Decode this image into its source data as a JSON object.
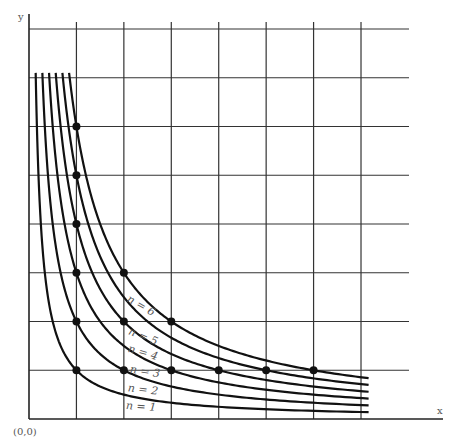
{
  "chart_data": {
    "type": "line",
    "title": "",
    "xlabel": "x",
    "ylabel": "y",
    "origin_label": "(0,0)",
    "xlim": [
      0,
      8.6
    ],
    "ylim": [
      0,
      8.2
    ],
    "grid": true,
    "grid_x_ticks": [
      1,
      2,
      3,
      4,
      5,
      6,
      7
    ],
    "grid_y_ticks": [
      1,
      2,
      3,
      4,
      5,
      6,
      7,
      8
    ],
    "curve_x_range_end": 7.16,
    "curve_y_top": 7.1,
    "series": [
      {
        "name": "n = 1",
        "n": 1,
        "points": [
          [
            1,
            1
          ]
        ]
      },
      {
        "name": "n = 2",
        "n": 2,
        "points": [
          [
            1,
            2
          ],
          [
            2,
            1
          ]
        ]
      },
      {
        "name": "n = 3",
        "n": 3,
        "points": [
          [
            1,
            3
          ],
          [
            3,
            1
          ]
        ]
      },
      {
        "name": "n = 4",
        "n": 4,
        "points": [
          [
            1,
            4
          ],
          [
            2,
            2
          ],
          [
            4,
            1
          ]
        ]
      },
      {
        "name": "n = 5",
        "n": 5,
        "points": [
          [
            1,
            5
          ],
          [
            5,
            1
          ]
        ]
      },
      {
        "name": "n = 6",
        "n": 6,
        "points": [
          [
            1,
            6
          ],
          [
            2,
            3
          ],
          [
            3,
            2
          ],
          [
            6,
            1
          ]
        ]
      }
    ],
    "labels": [
      {
        "text": "n = 1",
        "x": 141,
        "y": 407,
        "rot": 4
      },
      {
        "text": "n = 2",
        "x": 143,
        "y": 390,
        "rot": 7
      },
      {
        "text": "n = 3",
        "x": 145,
        "y": 372,
        "rot": 9
      },
      {
        "text": "n = 4",
        "x": 143,
        "y": 353,
        "rot": 16
      },
      {
        "text": "n = 5",
        "x": 143,
        "y": 337,
        "rot": 22
      },
      {
        "text": "n = 6",
        "x": 141,
        "y": 306,
        "rot": 30
      }
    ]
  }
}
